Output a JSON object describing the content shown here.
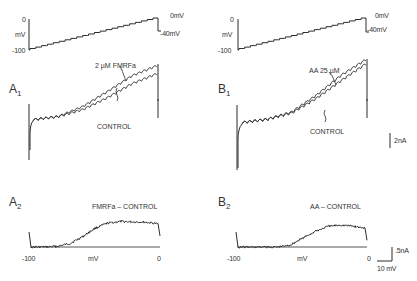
{
  "figure": {
    "panels": {
      "top_left": {
        "axis_top": "0",
        "axis_unit": "mV",
        "axis_bottom": "-100",
        "end_high": "0mV",
        "end_low": "-40mV"
      },
      "top_right": {
        "axis_top": "0",
        "axis_unit": "mV",
        "axis_bottom": "-100",
        "end_high": "0mV",
        "end_low": "-40mV"
      },
      "A1": {
        "label": "A",
        "sub": "1",
        "treated_label": "2 µM FMRFa",
        "control_label": "CONTROL"
      },
      "B1": {
        "label": "B",
        "sub": "1",
        "treated_label": "AA 25 µM",
        "control_label": "CONTROL",
        "scale": "2nA"
      },
      "A2": {
        "label": "A",
        "sub": "2",
        "title": "FMRFa – CONTROL",
        "x_left": "-100",
        "x_mid": "mV",
        "x_right": "0"
      },
      "B2": {
        "label": "B",
        "sub": "2",
        "title": "AA – CONTROL",
        "x_left": "-100",
        "x_mid": "mV",
        "x_right": "0",
        "scale_y": ".5nA",
        "scale_x": "10 mV"
      }
    }
  },
  "chart_data": [
    {
      "type": "line",
      "title": "Voltage ramp protocol",
      "ylabel": "mV",
      "y_ticks": [
        "0",
        "-100"
      ],
      "x": [
        0,
        1
      ],
      "series": [
        {
          "name": "command voltage",
          "values": [
            -100,
            0
          ]
        }
      ],
      "annotations": [
        "0mV",
        "-40mV"
      ],
      "ylim": [
        -100,
        0
      ]
    },
    {
      "type": "line",
      "title": "A1 ramp currents",
      "x": [
        -100,
        -80,
        -60,
        -40,
        -20,
        0
      ],
      "series": [
        {
          "name": "CONTROL",
          "values": [
            0,
            0.3,
            1.0,
            2.2,
            3.6,
            4.6
          ]
        },
        {
          "name": "2 µM FMRFa",
          "values": [
            0,
            0.3,
            1.3,
            2.8,
            4.4,
            5.4
          ]
        }
      ],
      "scale_bar": "2nA"
    },
    {
      "type": "line",
      "title": "B1 ramp currents",
      "x": [
        -100,
        -80,
        -60,
        -40,
        -20,
        0
      ],
      "series": [
        {
          "name": "CONTROL",
          "values": [
            0,
            0.3,
            0.9,
            2.3,
            4.0,
            5.6
          ]
        },
        {
          "name": "AA 25 µM",
          "values": [
            0,
            0.3,
            1.0,
            2.6,
            4.5,
            6.0
          ]
        }
      ],
      "scale_bar": "2nA"
    },
    {
      "type": "line",
      "title": "FMRFa – CONTROL",
      "xlabel": "mV",
      "x_ticks": [
        "-100",
        "0"
      ],
      "x": [
        -100,
        -90,
        -80,
        -70,
        -60,
        -50,
        -40,
        -30,
        -20,
        -10,
        0
      ],
      "series": [
        {
          "name": "difference current",
          "values": [
            0.0,
            0.0,
            0.02,
            0.1,
            0.3,
            0.55,
            0.7,
            0.75,
            0.74,
            0.73,
            0.68
          ]
        }
      ],
      "xlim": [
        -100,
        0
      ]
    },
    {
      "type": "line",
      "title": "AA – CONTROL",
      "xlabel": "mV",
      "x_ticks": [
        "-100",
        "0"
      ],
      "x": [
        -100,
        -90,
        -80,
        -70,
        -60,
        -50,
        -40,
        -30,
        -20,
        -10,
        0
      ],
      "series": [
        {
          "name": "difference current",
          "values": [
            0.0,
            0.0,
            0.0,
            0.0,
            0.05,
            0.25,
            0.45,
            0.6,
            0.65,
            0.62,
            0.55
          ]
        }
      ],
      "xlim": [
        -100,
        0
      ],
      "scale_bar": {
        "y": ".5nA",
        "x": "10 mV"
      }
    }
  ]
}
